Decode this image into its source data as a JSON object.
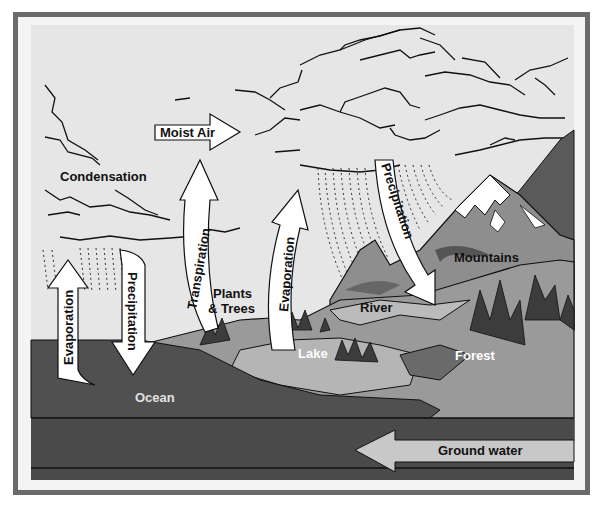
{
  "diagram": {
    "colors": {
      "frame": "#6b6b6b",
      "sky": "#e6e6e6",
      "ocean": "#505050",
      "ground_deep": "#4a4a4a",
      "land_light": "#9a9a9a",
      "land_mid": "#7a7a7a",
      "lake": "#b0b0b0",
      "trees": "#3c3c3c",
      "arrow_fill": "#ffffff",
      "groundwater_arrow": "#c8c8c8"
    },
    "labels": {
      "moist_air": "Moist Air",
      "condensation": "Condensation",
      "transpiration": "Transpiration",
      "evaporation_ocean": "Evaporation",
      "precipitation_ocean": "Precipitation",
      "evaporation_lake": "Evaporation",
      "precipitation_mountain": "Precipitation",
      "plants_trees_line1": "Plants",
      "plants_trees_line2": "& Trees",
      "mountains": "Mountains",
      "river": "River",
      "lake": "Lake",
      "forest": "Forest",
      "ocean": "Ocean",
      "ground_water": "Ground water"
    }
  }
}
